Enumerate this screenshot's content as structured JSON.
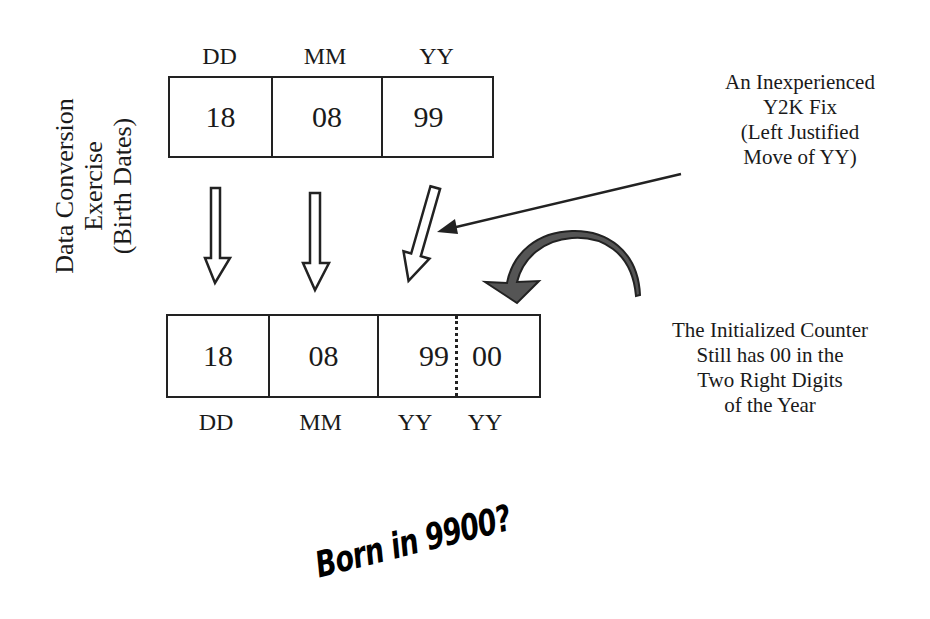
{
  "side_title": {
    "lines": [
      "Data Conversion",
      "Exercise",
      "(Birth Dates)"
    ]
  },
  "top_record": {
    "headers": [
      "DD",
      "MM",
      "YY"
    ],
    "values": [
      "18",
      "08",
      "99"
    ]
  },
  "bottom_record": {
    "values": [
      "18",
      "08",
      "99",
      "00"
    ],
    "footers": [
      "DD",
      "MM",
      "YY",
      "YY"
    ]
  },
  "callout_fix": {
    "lines": [
      "An Inexperienced",
      "Y2K Fix",
      "(Left Justified",
      "Move of YY)"
    ]
  },
  "callout_counter": {
    "lines": [
      "The Initialized Counter",
      "Still has 00 in the",
      "Two Right Digits",
      "of the Year"
    ]
  },
  "punchline": "Born in 9900?",
  "colors": {
    "stroke": "#222222",
    "curved_arrow_fill": "#555555",
    "background": "#ffffff"
  }
}
